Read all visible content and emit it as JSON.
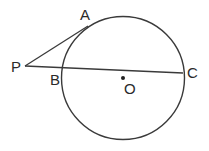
{
  "diagram": {
    "type": "geometry",
    "labels": {
      "A": "A",
      "P": "P",
      "B": "B",
      "C": "C",
      "O": "O"
    },
    "colors": {
      "stroke": "#3a3a3a",
      "text": "#2a2a2a",
      "background": "#ffffff"
    }
  }
}
